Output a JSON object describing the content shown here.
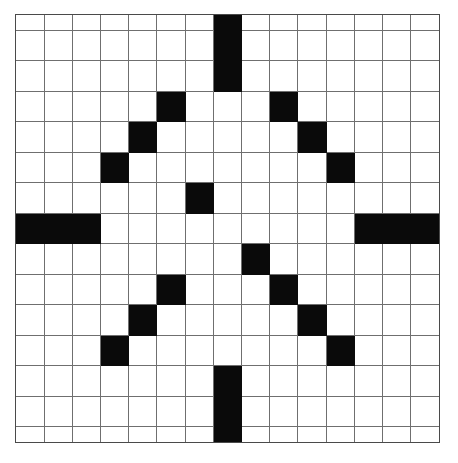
{
  "page": {
    "background_color": "#ffffff"
  },
  "grid": {
    "name": "crossword-grid",
    "rows": 15,
    "columns": 15,
    "cell_size_px": 28.3,
    "origin_x_px": 15,
    "origin_y_px": 14,
    "width_px": 425,
    "height_px": 429,
    "blocked_color": "#0a0a0a",
    "open_color": "#ffffff",
    "line_color": "#6f6f6f",
    "border_color": "#4a4a4a",
    "symmetry": "four-fold rotational (snowflake / star)",
    "blocked_count": 26,
    "blocked_cells": [
      [
        0,
        7
      ],
      [
        1,
        7
      ],
      [
        2,
        7
      ],
      [
        3,
        5
      ],
      [
        3,
        9
      ],
      [
        4,
        4
      ],
      [
        4,
        10
      ],
      [
        5,
        3
      ],
      [
        5,
        11
      ],
      [
        6,
        6
      ],
      [
        7,
        0
      ],
      [
        7,
        1
      ],
      [
        7,
        2
      ],
      [
        7,
        12
      ],
      [
        7,
        13
      ],
      [
        7,
        14
      ],
      [
        8,
        8
      ],
      [
        9,
        5
      ],
      [
        9,
        9
      ],
      [
        10,
        4
      ],
      [
        10,
        10
      ],
      [
        11,
        3
      ],
      [
        11,
        11
      ],
      [
        12,
        7
      ],
      [
        13,
        7
      ],
      [
        14,
        7
      ]
    ],
    "cell_labels": {
      "blocked": "blocked-cell",
      "open": "open-cell"
    }
  }
}
